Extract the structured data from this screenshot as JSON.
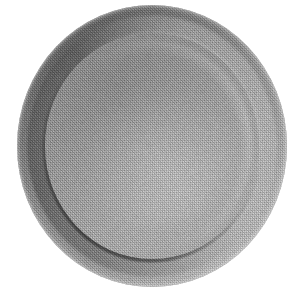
{
  "image": {
    "domain": "Natural-Image",
    "subject": "plate",
    "description": "Grayscale halftone catalog photograph of a single round ceramic dinner plate viewed from directly above, centered on a plain white background.",
    "alt_text": "Round grey plate, top-down view, white background",
    "rendering": "dithered halftone grayscale scan",
    "background_color": "#ffffff",
    "object_count": "1"
  },
  "geometry": {
    "canvas_width": "301",
    "canvas_height": "292",
    "plate_left": "17",
    "plate_top": "5",
    "plate_width": "270",
    "plate_height": "282",
    "center_x": "152",
    "center_y": "146",
    "rim_width_ratio": "0.105",
    "well_diameter_ratio": "0.79"
  },
  "palette": {
    "background": "#ffffff",
    "plate_base": "#b2b2b2",
    "well_fill": "#b4b4b4",
    "rim_highlight": "#d6d6d6",
    "rim_midtone": "#bdbdbd",
    "inner_shadow": "#5e5e5e",
    "outer_shadow": "#8f8f8f",
    "edge_line": "#9a9a9a"
  },
  "lighting": {
    "source_direction": "lower-right",
    "highlight_zone": "right and bottom rim",
    "shadow_zone": "upper-left inner rim",
    "shadow_intensity": "strong",
    "specular": "diffuse"
  },
  "regions": [
    {
      "name": "outer-rim",
      "label": "Outer rim",
      "tone": "light to mid grey"
    },
    {
      "name": "rim-shadow-band",
      "label": "Inner rim shadow band",
      "tone": "dark grey crescent"
    },
    {
      "name": "plate-well",
      "label": "Plate well",
      "tone": "flat mid grey"
    },
    {
      "name": "background",
      "label": "Background",
      "tone": "white"
    }
  ]
}
